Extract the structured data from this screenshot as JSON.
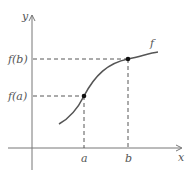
{
  "diagram": {
    "axes": {
      "x_label": "x",
      "y_label": "y"
    },
    "curve_label": "f",
    "points": [
      {
        "name": "a",
        "x_label": "a",
        "y_label": "f(a)"
      },
      {
        "name": "b",
        "x_label": "b",
        "y_label": "f(b)"
      }
    ],
    "colors": {
      "axis": "#666666",
      "curve": "#555555",
      "dash": "#444444",
      "point": "#111111"
    }
  }
}
